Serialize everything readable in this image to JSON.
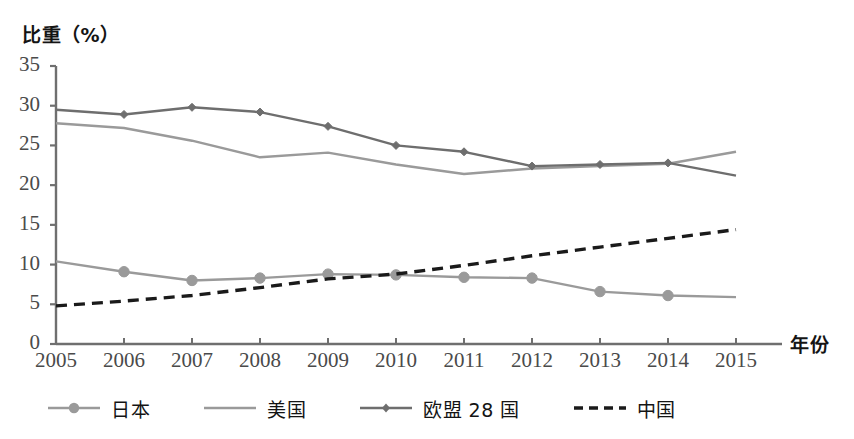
{
  "chart_data": {
    "type": "line",
    "title": "",
    "ylabel": "比重（%）",
    "xlabel": "年份",
    "x": [
      2005,
      2006,
      2007,
      2008,
      2009,
      2010,
      2011,
      2012,
      2013,
      2014,
      2015
    ],
    "categories": [
      "2005",
      "2006",
      "2007",
      "2008",
      "2009",
      "2010",
      "2011",
      "2012",
      "2013",
      "2014",
      "2015"
    ],
    "ylim": [
      0,
      35
    ],
    "yticks": [
      0,
      5,
      10,
      15,
      20,
      25,
      30,
      35
    ],
    "ytick_labels": [
      "0",
      "5",
      "10",
      "15",
      "20",
      "25",
      "30",
      "35"
    ],
    "grid": false,
    "legend_position": "bottom",
    "series": [
      {
        "name": "日本",
        "marker": "circle",
        "line_style": "solid",
        "color": "#9a9a9a",
        "values": [
          10.4,
          9.1,
          8.0,
          8.3,
          8.8,
          8.7,
          8.4,
          8.3,
          6.6,
          6.1,
          5.9
        ]
      },
      {
        "name": "美国",
        "marker": "none",
        "line_style": "solid",
        "color": "#9a9a9a",
        "values": [
          27.8,
          27.2,
          25.6,
          23.5,
          24.1,
          22.6,
          21.4,
          22.1,
          22.4,
          22.7,
          24.2
        ]
      },
      {
        "name": "欧盟 28 国",
        "marker": "diamond",
        "line_style": "solid",
        "color": "#6e6e6e",
        "values": [
          29.5,
          28.9,
          29.8,
          29.2,
          27.4,
          25.0,
          24.2,
          22.4,
          22.6,
          22.8,
          21.2
        ]
      },
      {
        "name": "中国",
        "marker": "none",
        "line_style": "dashed",
        "color": "#1a1a1a",
        "values": [
          4.8,
          5.4,
          6.1,
          7.1,
          8.2,
          8.8,
          9.9,
          11.1,
          12.2,
          13.3,
          14.4
        ]
      }
    ]
  },
  "colors": {
    "axis": "#6f6f6f",
    "japan": "#9a9a9a",
    "usa": "#9a9a9a",
    "eu": "#6e6e6e",
    "china": "#1a1a1a",
    "tick_text": "#4a4a4a",
    "label_text": "#141414"
  }
}
